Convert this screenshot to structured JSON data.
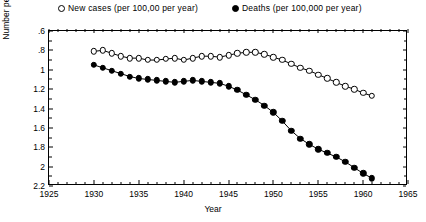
{
  "legend": {
    "position": "above-plot",
    "entries": [
      {
        "marker": "open-circle-marker",
        "label": "New cases (per 100,00 per year)"
      },
      {
        "marker": "filled-circle-marker",
        "label": "Deaths (per 100,000 per year)"
      }
    ]
  },
  "axes": {
    "xlabel": "Year",
    "ylabel": "Number per year (log scale)",
    "xticks": [
      "1925",
      "1930",
      "1935",
      "1940",
      "1945",
      "1950",
      "1955",
      "1960",
      "1965"
    ],
    "yticks": [
      "2.2",
      "2",
      "1.8",
      "1.6",
      "1.4",
      "1.2",
      "1",
      ".8",
      ".6"
    ]
  },
  "colors": {
    "axis": "#000000",
    "series_new_cases": "#000000",
    "series_deaths": "#000000",
    "background": "#ffffff"
  },
  "chart_data": {
    "type": "scatter",
    "title": "",
    "xlabel": "Year",
    "ylabel": "Number per year (log scale)",
    "xlim": [
      1925,
      1965
    ],
    "ylim": [
      0.6,
      2.2
    ],
    "grid": false,
    "legend_position": "top",
    "xticks": [
      1925,
      1930,
      1935,
      1940,
      1945,
      1950,
      1955,
      1960,
      1965
    ],
    "yticks": [
      0.6,
      0.8,
      1.0,
      1.2,
      1.4,
      1.6,
      1.8,
      2.0,
      2.2
    ],
    "x": [
      1930,
      1931,
      1932,
      1933,
      1934,
      1935,
      1936,
      1937,
      1938,
      1939,
      1940,
      1941,
      1942,
      1943,
      1944,
      1945,
      1946,
      1947,
      1948,
      1949,
      1950,
      1951,
      1952,
      1953,
      1954,
      1955,
      1956,
      1957,
      1958,
      1959,
      1960,
      1961
    ],
    "series": [
      {
        "name": "New cases (per 100,00 per year)",
        "marker": "open-circle",
        "values": [
          1.99,
          2.0,
          1.97,
          1.94,
          1.92,
          1.92,
          1.9,
          1.9,
          1.91,
          1.92,
          1.9,
          1.92,
          1.94,
          1.94,
          1.93,
          1.95,
          1.97,
          1.98,
          1.98,
          1.96,
          1.93,
          1.9,
          1.86,
          1.82,
          1.79,
          1.75,
          1.71,
          1.67,
          1.63,
          1.6,
          1.56,
          1.53
        ]
      },
      {
        "name": "Deaths (per 100,000 per year)",
        "marker": "filled-circle",
        "values": [
          1.85,
          1.82,
          1.79,
          1.76,
          1.73,
          1.71,
          1.7,
          1.69,
          1.68,
          1.67,
          1.68,
          1.69,
          1.68,
          1.67,
          1.66,
          1.63,
          1.59,
          1.54,
          1.49,
          1.43,
          1.36,
          1.27,
          1.17,
          1.09,
          1.03,
          0.98,
          0.94,
          0.9,
          0.85,
          0.79,
          0.73,
          0.68
        ]
      }
    ]
  }
}
